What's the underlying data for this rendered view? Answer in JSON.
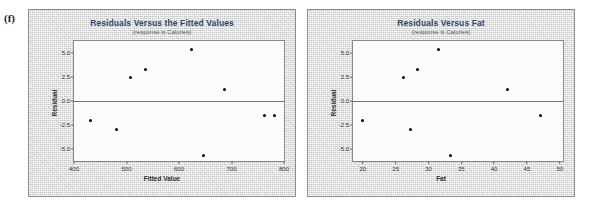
{
  "figure": {
    "panel_label": "(f)"
  },
  "charts": [
    {
      "id": "residuals-vs-fitted",
      "title": "Residuals Versus the Fitted Values",
      "subtitle": "(response is Calories)",
      "xlabel": "Fitted Value",
      "ylabel": "Residual",
      "xticks": [
        "400",
        "500",
        "600",
        "700",
        "800"
      ],
      "yticks": [
        "5.0",
        "2.5",
        "0.0",
        "-2.5",
        "-5.0"
      ]
    },
    {
      "id": "residuals-vs-fat",
      "title": "Residuals Versus Fat",
      "subtitle": "(response is Calories)",
      "xlabel": "Fat",
      "ylabel": "Residual",
      "xticks": [
        "20",
        "25",
        "30",
        "35",
        "40",
        "45",
        "50"
      ],
      "yticks": [
        "5.0",
        "2.5",
        "0.0",
        "-2.5",
        "-5.0"
      ]
    }
  ],
  "colors": {
    "title": "#33476b",
    "subtitle": "#4a5a78",
    "point": "#000000",
    "frame": "#8e8e8e",
    "plot_background": "#fbfbfb",
    "page_background": "#e9e9e9",
    "zero_line": "#6f6f6f"
  },
  "chart_data": [
    {
      "type": "scatter",
      "title": "Residuals Versus the Fitted Values",
      "subtitle": "(response is Calories)",
      "xlabel": "Fitted Value",
      "ylabel": "Residual",
      "xlim": [
        400,
        800
      ],
      "ylim": [
        -6.2,
        6.2
      ],
      "xticks": [
        400,
        500,
        600,
        700,
        800
      ],
      "yticks": [
        -5.0,
        -2.5,
        0.0,
        2.5,
        5.0
      ],
      "grid": false,
      "legend": null,
      "reference_line": {
        "orientation": "horizontal",
        "y": 0.0
      },
      "x": [
        432,
        480,
        508,
        536,
        624,
        646,
        686,
        762,
        782
      ],
      "y": [
        -2.0,
        -2.9,
        2.4,
        3.3,
        5.3,
        -5.6,
        1.2,
        -1.5,
        -1.5
      ],
      "points": [
        {
          "x": 432,
          "y": -2.0
        },
        {
          "x": 480,
          "y": -2.9
        },
        {
          "x": 508,
          "y": 2.4
        },
        {
          "x": 536,
          "y": 3.3
        },
        {
          "x": 624,
          "y": 5.3
        },
        {
          "x": 646,
          "y": -5.6
        },
        {
          "x": 686,
          "y": 1.2
        },
        {
          "x": 762,
          "y": -1.5
        },
        {
          "x": 782,
          "y": -1.5
        }
      ]
    },
    {
      "type": "scatter",
      "title": "Residuals Versus Fat",
      "subtitle": "(response is Calories)",
      "xlabel": "Fat",
      "ylabel": "Residual",
      "xlim": [
        18.5,
        50.5
      ],
      "ylim": [
        -6.2,
        6.2
      ],
      "xticks": [
        20,
        25,
        30,
        35,
        40,
        45,
        50
      ],
      "yticks": [
        -5.0,
        -2.5,
        0.0,
        2.5,
        5.0
      ],
      "grid": false,
      "legend": null,
      "reference_line": {
        "orientation": "horizontal",
        "y": 0.0
      },
      "x": [
        20.0,
        26.2,
        27.3,
        28.4,
        31.6,
        33.4,
        42.0,
        47.0
      ],
      "y": [
        -2.0,
        2.4,
        -2.9,
        3.3,
        5.3,
        -5.6,
        1.2,
        -1.5
      ],
      "points": [
        {
          "x": 20.0,
          "y": -2.0
        },
        {
          "x": 26.2,
          "y": 2.4
        },
        {
          "x": 27.3,
          "y": -2.9
        },
        {
          "x": 28.4,
          "y": 3.3
        },
        {
          "x": 31.6,
          "y": 5.3
        },
        {
          "x": 33.4,
          "y": -5.6
        },
        {
          "x": 42.0,
          "y": 1.2
        },
        {
          "x": 47.0,
          "y": -1.5
        }
      ]
    }
  ]
}
